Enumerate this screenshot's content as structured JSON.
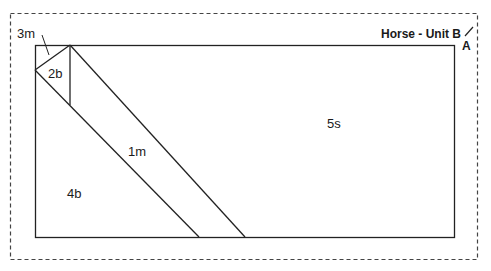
{
  "diagram": {
    "title": "Horse - Unit B",
    "corner_mark": "A",
    "regions": [
      {
        "id": "3m",
        "label": "3m"
      },
      {
        "id": "2b",
        "label": "2b"
      },
      {
        "id": "1m",
        "label": "1m"
      },
      {
        "id": "4b",
        "label": "4b"
      },
      {
        "id": "5s",
        "label": "5s"
      }
    ],
    "colors": {
      "line": "#222222",
      "dash": "#444444",
      "background": "#ffffff"
    }
  }
}
